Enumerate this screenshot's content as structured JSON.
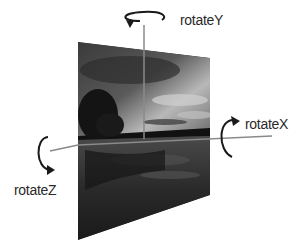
{
  "diagram": {
    "axes": [
      {
        "id": "y",
        "label": "rotateY",
        "orientation": "vertical"
      },
      {
        "id": "x",
        "label": "rotateX",
        "orientation": "horizontal"
      },
      {
        "id": "z",
        "label": "rotateZ",
        "orientation": "depth"
      }
    ],
    "image": {
      "description": "grayscale lake landscape at dusk with tree and clouds"
    },
    "colors": {
      "axis_line": "#8a8a8a",
      "arrow": "#1a1a1a",
      "text": "#2a2a2a"
    }
  }
}
